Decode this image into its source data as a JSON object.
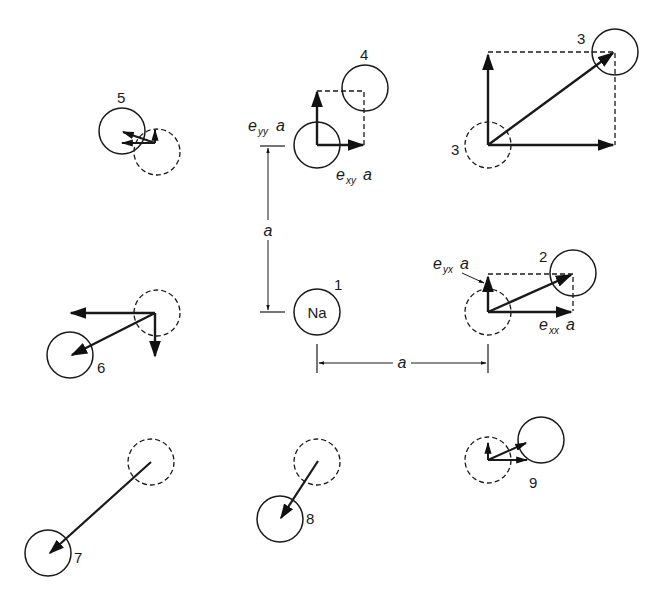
{
  "figure": {
    "central_atom": {
      "label": "Na",
      "number": "1"
    },
    "lattice_constant_label": "a",
    "strain_labels": {
      "e_yy": {
        "e": "e",
        "sub": "yy",
        "a": "a"
      },
      "e_xy": {
        "e": "e",
        "sub": "xy",
        "a": "a"
      },
      "e_yx": {
        "e": "e",
        "sub": "yx",
        "a": "a"
      },
      "e_xx": {
        "e": "e",
        "sub": "xx",
        "a": "a"
      }
    },
    "site_numbers": {
      "s2": "2",
      "s3_displaced": "3",
      "s3_equilibrium": "3",
      "s4": "4",
      "s5": "5",
      "s6": "6",
      "s7": "7",
      "s8": "8",
      "s9": "9"
    }
  }
}
